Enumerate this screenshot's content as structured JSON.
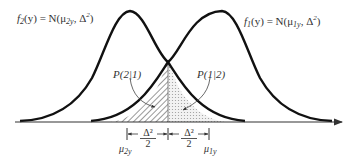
{
  "diagram": {
    "type": "overlapping-normal-densities",
    "curves": [
      {
        "id": "f2",
        "label_func": "f",
        "label_sub": "2",
        "label_rest": "(y) = N(μ",
        "mean_sub": "2y",
        "variance": ", Δ",
        "variance_sup": "2",
        "close": ")",
        "mean_x": 130
      },
      {
        "id": "f1",
        "label_func": "f",
        "label_sub": "1",
        "label_rest": "(y) = N(μ",
        "mean_sub": "1y",
        "variance": ", Δ",
        "variance_sup": "2",
        "close": ")",
        "mean_x": 222
      }
    ],
    "regions": [
      {
        "id": "p21",
        "label": "P(2|1)",
        "fill": "hatched"
      },
      {
        "id": "p12",
        "label": "P(1|2)",
        "fill": "dotted"
      }
    ],
    "axis_marks": {
      "mu2": {
        "symbol": "μ",
        "sub": "2y"
      },
      "mu1": {
        "symbol": "μ",
        "sub": "1y"
      },
      "half_gap_num": "Δ²",
      "half_gap_den": "2"
    },
    "colors": {
      "curve": "#111111",
      "axis": "#333333",
      "hatch": "#444444",
      "dot": "#999999"
    }
  }
}
